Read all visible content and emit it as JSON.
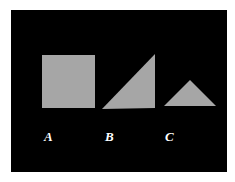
{
  "figure": {
    "background": "#000000",
    "shape_fill": "#a6a6a6",
    "label_color": "#ffffff",
    "shapes": [
      {
        "id": "A",
        "type": "square",
        "label": "A"
      },
      {
        "id": "B",
        "type": "right-triangle",
        "label": "B"
      },
      {
        "id": "C",
        "type": "isosceles-triangle",
        "label": "C"
      }
    ]
  }
}
